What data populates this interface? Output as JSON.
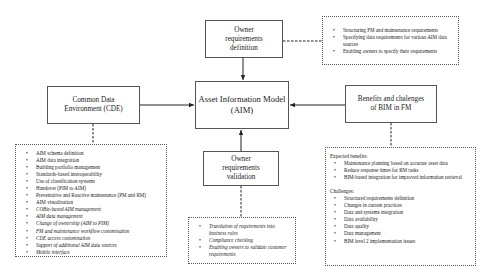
{
  "nodes": {
    "aim": {
      "line1": "Asset Information Model",
      "line2": "(AIM)"
    },
    "owner_definition": {
      "line1": "Owner",
      "line2": "requirements",
      "line3": "definition"
    },
    "owner_validation": {
      "line1": "Owner",
      "line2": "requirements",
      "line3": "validation"
    },
    "cde": {
      "line1": "Common Data",
      "line2": "Environment (CDE)"
    },
    "benefits": {
      "line1": "Benefits and chalenges",
      "line2": "of BIM in FM"
    }
  },
  "details": {
    "owner_definition": [
      "Structuring FM and maintenance requirements",
      "Specifying data requirements for various AIM data sources",
      "Enabling owners to specify their requirements"
    ],
    "cde": {
      "regular": [
        "AIM schema definition",
        "AIM data integration",
        "Building portfolio management",
        "Standards-based interoperability",
        "Use of classification systems",
        "Handover (PIM to AIM)",
        "Preventative and Reactive maintenance (PM and RM)",
        "AIM visualisation"
      ],
      "italic": [
        "COBie-based AIM management",
        "AIM data management",
        "Change of ownership (AIM to PIM)",
        "FM and maintenance workflow customisation",
        "CDE access customisation",
        "Support of additional AIM data sources",
        "Mobile interface"
      ]
    },
    "owner_validation": [
      "Translation of requirements into business rules",
      "Compliance checking",
      "Enabling owners to validate customer requirements"
    ],
    "benefits": {
      "benefits_header": "Expected benefits:",
      "benefits_items": [
        "Maintenance planning based on accurate asset data",
        "Reduce response times for RM tasks",
        "BIM-based integration for improved information retrieval"
      ],
      "challenges_header": "Challenges:",
      "challenges_items": [
        "Structured requirements definition",
        "Changes in current practices",
        "Data and systems integration",
        "Data availability",
        "Data quality",
        "Data management",
        "BIM level 2 implementation issues"
      ]
    }
  }
}
